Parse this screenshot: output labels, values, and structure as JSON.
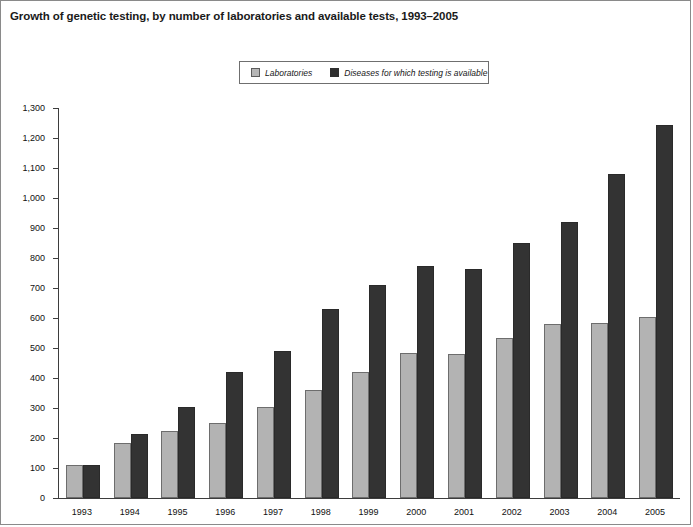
{
  "figure": {
    "title": "Growth of genetic testing, by number of laboratories and available tests, 1993–2005",
    "border_color": "#8a8a8a",
    "background": "#ffffff"
  },
  "legend": {
    "position": "top-center",
    "items": [
      {
        "label": "Laboratories",
        "color": "#b3b3b3",
        "swatch": "legend-swatch-laboratories"
      },
      {
        "label": "Diseases for which testing is available",
        "color": "#333333",
        "swatch": "legend-swatch-diseases"
      }
    ]
  },
  "chart_data": {
    "type": "bar",
    "title": "Growth of genetic testing, by number of laboratories and available tests, 1993–2005",
    "xlabel": "",
    "ylabel": "",
    "ylim": [
      0,
      1300
    ],
    "ytick_step": 100,
    "grid": false,
    "legend_position": "top-center",
    "categories": [
      "1993",
      "1994",
      "1995",
      "1996",
      "1997",
      "1998",
      "1999",
      "2000",
      "2001",
      "2002",
      "2003",
      "2004",
      "2005"
    ],
    "ytick_labels": [
      "0",
      "100",
      "200",
      "300",
      "400",
      "500",
      "600",
      "700",
      "800",
      "900",
      "1,000",
      "1,100",
      "1,200",
      "1,300"
    ],
    "series": [
      {
        "name": "Laboratories",
        "color": "#b3b3b3",
        "values": [
          110,
          185,
          225,
          250,
          305,
          360,
          420,
          485,
          480,
          535,
          580,
          583,
          605
        ]
      },
      {
        "name": "Diseases for which testing is available",
        "color": "#333333",
        "values": [
          110,
          215,
          305,
          420,
          490,
          630,
          710,
          775,
          765,
          850,
          920,
          1080,
          1245
        ]
      }
    ]
  }
}
